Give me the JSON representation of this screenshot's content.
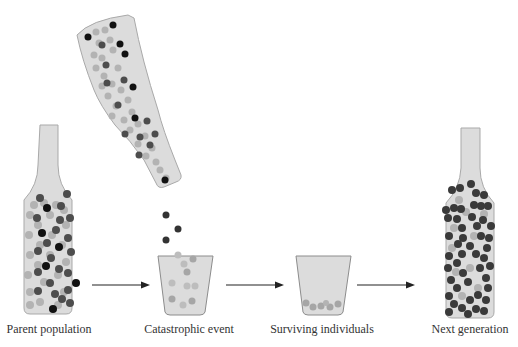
{
  "colors": {
    "container_fill": "#d9d9d9",
    "container_stroke": "#a6a6a6",
    "light_ball": "#b3b3b3",
    "dark_ball": "#4d4d4d",
    "black_ball": "#111111",
    "arrow": "#222222"
  },
  "stages": [
    {
      "id": "parent",
      "label": "Parent population",
      "center_x": 49
    },
    {
      "id": "catastrophe",
      "label": "Catastrophic event",
      "center_x": 189
    },
    {
      "id": "survivors",
      "label": "Surviving individuals",
      "center_x": 322
    },
    {
      "id": "next",
      "label": "Next generation",
      "center_x": 470
    }
  ],
  "arrows": [
    {
      "from": "parent",
      "to": "catastrophe"
    },
    {
      "from": "catastrophe",
      "to": "survivors"
    },
    {
      "from": "survivors",
      "to": "next"
    }
  ]
}
